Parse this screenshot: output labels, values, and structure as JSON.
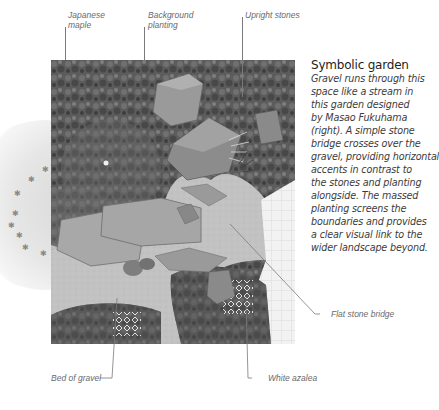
{
  "caption": {
    "title": "Symbolic garden",
    "body_lines": [
      "Gravel runs through this",
      "space like a stream in",
      "this garden designed",
      "by Masao Fukuhama",
      "(right). A simple stone",
      "bridge crosses over the",
      "gravel, providing horizontal",
      "accents in contrast to",
      "the stones and planting",
      "alongside. The massed",
      "planting screens the",
      "boundaries and provides",
      "a clear visual link to the",
      "wider landscape beyond."
    ]
  },
  "labels": {
    "japanese_maple": "Japanese\nmaple",
    "background_planting": "Background\nplanting",
    "upright_stones": "Upright stones",
    "flat_stone_bridge": "Flat stone bridge",
    "white_azalea": "White azalea",
    "bed_of_gravel": "Bed of gravel"
  },
  "colors": {
    "gravel": "#c4c4c4",
    "planting": "#5a5a5a",
    "stone": "#8e8e8e",
    "text": "#3c3c3c",
    "label": "#6a6a6a"
  }
}
